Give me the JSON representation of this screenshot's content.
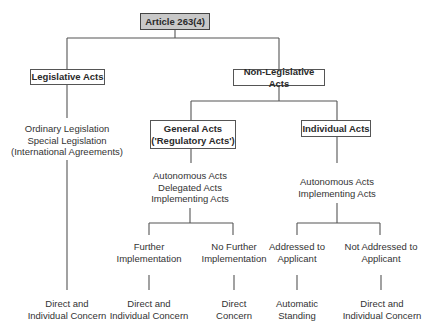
{
  "diagram": {
    "root": "Article 263(4)",
    "legislative": {
      "label": "Legislative Acts",
      "types": "Ordinary Legislation\nSpecial Legislation\n(International Agreements)",
      "standing": "Direct and\nIndividual Concern"
    },
    "non_legislative": {
      "label": "Non-Legislative Acts",
      "general": {
        "label": "General Acts\n('Regulatory Acts')",
        "types": "Autonomous Acts\nDelegated Acts\nImplementing Acts",
        "further": {
          "label": "Further\nImplementation",
          "standing": "Direct and\nIndividual Concern"
        },
        "no_further": {
          "label": "No Further\nImplementation",
          "standing": "Direct\nConcern"
        }
      },
      "individual": {
        "label": "Individual Acts",
        "types": "Autonomous Acts\nImplementing Acts",
        "addressed": {
          "label": "Addressed to\nApplicant",
          "standing": "Automatic\nStanding"
        },
        "not_addressed": {
          "label": "Not Addressed to\nApplicant",
          "standing": "Direct and\nIndividual Concern"
        }
      }
    }
  },
  "colors": {
    "root_fill": "#c8c8c8",
    "line": "#555555",
    "text": "#333333"
  }
}
